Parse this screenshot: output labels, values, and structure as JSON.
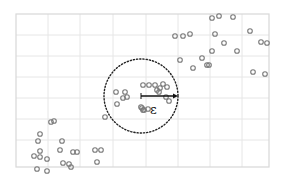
{
  "chart_data": {
    "type": "scatter",
    "title": "",
    "xlabel": "",
    "ylabel": "",
    "grid": true,
    "frame": {
      "x": 16,
      "y": 14,
      "width": 253,
      "height": 153
    },
    "gridlines": {
      "x": [
        48,
        80,
        113,
        146,
        178,
        210,
        242
      ],
      "y": [
        35,
        56,
        77,
        98,
        119,
        140
      ]
    },
    "points": [
      [
        212,
        18
      ],
      [
        219,
        16
      ],
      [
        233,
        17
      ],
      [
        175,
        36
      ],
      [
        183,
        36
      ],
      [
        190,
        34
      ],
      [
        215,
        34
      ],
      [
        250,
        31
      ],
      [
        261,
        42
      ],
      [
        267,
        43
      ],
      [
        224,
        43
      ],
      [
        212,
        51
      ],
      [
        237,
        51
      ],
      [
        180,
        60
      ],
      [
        202,
        58
      ],
      [
        207,
        65
      ],
      [
        209,
        65
      ],
      [
        193,
        68
      ],
      [
        253,
        72
      ],
      [
        265,
        74
      ],
      [
        143,
        85
      ],
      [
        149,
        85
      ],
      [
        155,
        85
      ],
      [
        163,
        84
      ],
      [
        167,
        87
      ],
      [
        160,
        88
      ],
      [
        157,
        90
      ],
      [
        159,
        92
      ],
      [
        116,
        92
      ],
      [
        125,
        92
      ],
      [
        123,
        98
      ],
      [
        127,
        97
      ],
      [
        166,
        97
      ],
      [
        169,
        101
      ],
      [
        117,
        104
      ],
      [
        142,
        108
      ],
      [
        143,
        110
      ],
      [
        144,
        110
      ],
      [
        148,
        109
      ],
      [
        141,
        107
      ],
      [
        105,
        117
      ],
      [
        51,
        122
      ],
      [
        54,
        121
      ],
      [
        40,
        134
      ],
      [
        38,
        141
      ],
      [
        62,
        141
      ],
      [
        60,
        150
      ],
      [
        40,
        151
      ],
      [
        73,
        152
      ],
      [
        34,
        156
      ],
      [
        40,
        157
      ],
      [
        47,
        159
      ],
      [
        63,
        163
      ],
      [
        77,
        152
      ],
      [
        37,
        169
      ],
      [
        47,
        171
      ],
      [
        69,
        164
      ],
      [
        71,
        167
      ],
      [
        95,
        150
      ],
      [
        101,
        150
      ],
      [
        97,
        162
      ]
    ],
    "marker": {
      "shape": "open-circle",
      "radius": 2.3,
      "color": "#7a7a7a"
    },
    "annotation": {
      "circle": {
        "cx": 141,
        "cy": 96,
        "r": 37,
        "style": "dotted",
        "color": "#222222"
      },
      "arrow": {
        "x1": 141,
        "y1": 96,
        "x2": 178,
        "y2": 96,
        "color": "#111111"
      },
      "label": "ε",
      "label_pos": {
        "x": 150,
        "y": 114
      }
    }
  },
  "colors": {
    "background": "#ffffff",
    "grid": "#e6e6e6",
    "frame": "#d8d8d8",
    "marker": "#7a7a7a",
    "annotation": "#222222"
  }
}
